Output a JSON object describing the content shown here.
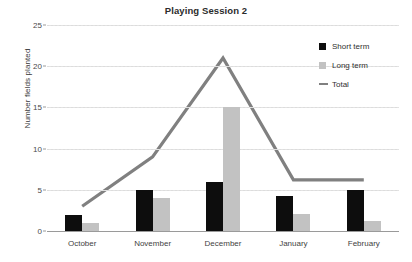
{
  "chart_data": {
    "type": "bar",
    "title": "Playing Session 2",
    "xlabel": "",
    "ylabel": "Number fields planted",
    "categories": [
      "October",
      "November",
      "December",
      "January",
      "February"
    ],
    "ylim": [
      0,
      25
    ],
    "yticks": [
      0,
      5,
      10,
      15,
      20,
      25
    ],
    "grid": true,
    "legend_position": "top-right",
    "series": [
      {
        "name": "Short term",
        "type": "bar",
        "color": "#0d0d0d",
        "values": [
          2,
          5,
          6,
          4.2,
          5
        ]
      },
      {
        "name": "Long term",
        "type": "bar",
        "color": "#c2c2c2",
        "values": [
          1,
          4,
          15,
          2.1,
          1.2
        ]
      },
      {
        "name": "Total",
        "type": "line",
        "color": "#808080",
        "values": [
          3,
          9,
          21,
          6.2,
          6.2
        ]
      }
    ]
  },
  "legend": {
    "items": [
      {
        "label": "Short term",
        "swatch": "square-black"
      },
      {
        "label": "Long term",
        "swatch": "square-gray"
      },
      {
        "label": "Total",
        "swatch": "line-gray"
      }
    ]
  },
  "axis": {
    "y_tick_labels": [
      "0",
      "5",
      "10",
      "15",
      "20",
      "25"
    ],
    "y_title": "Number fields planted"
  }
}
